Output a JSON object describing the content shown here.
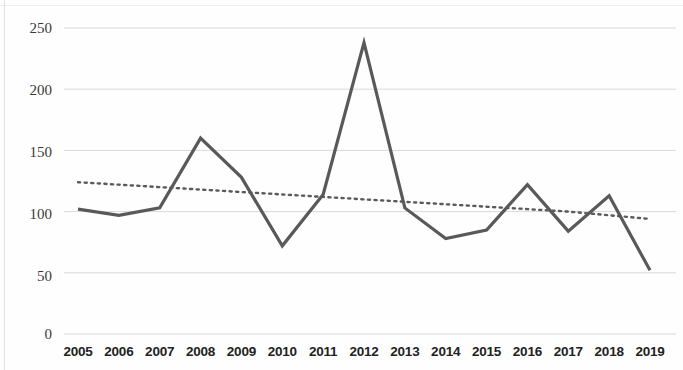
{
  "chart_data": {
    "type": "line",
    "title": "",
    "xlabel": "",
    "ylabel": "",
    "categories": [
      "2005",
      "2006",
      "2007",
      "2008",
      "2009",
      "2010",
      "2011",
      "2012",
      "2013",
      "2014",
      "2015",
      "2016",
      "2017",
      "2018",
      "2019"
    ],
    "ylim": [
      0,
      250
    ],
    "yticks": [
      0,
      50,
      100,
      150,
      200,
      250
    ],
    "ytick_labels": [
      "0",
      "50",
      "100",
      "150",
      "200",
      "250"
    ],
    "grid": true,
    "grid_axis": "y",
    "legend": "none",
    "series": [
      {
        "name": "values",
        "style": "solid",
        "color": "#595959",
        "width": 3.2,
        "values": [
          102,
          97,
          103,
          160,
          128,
          72,
          114,
          238,
          103,
          78,
          85,
          122,
          84,
          113,
          52
        ]
      },
      {
        "name": "trendline",
        "style": "dotted",
        "color": "#5a5a5a",
        "width": 2.4,
        "values": [
          124,
          122,
          120,
          118,
          116,
          114,
          112,
          110,
          108,
          106,
          104,
          102,
          100,
          97,
          94
        ]
      }
    ],
    "axis_color": "#d9d9d9",
    "background": "#ffffff"
  },
  "labels": {
    "y": [
      "250",
      "200",
      "150",
      "100",
      "50",
      "0"
    ],
    "x": [
      "2005",
      "2006",
      "2007",
      "2008",
      "2009",
      "2010",
      "2011",
      "2012",
      "2013",
      "2014",
      "2015",
      "2016",
      "2017",
      "2018",
      "2019"
    ]
  }
}
